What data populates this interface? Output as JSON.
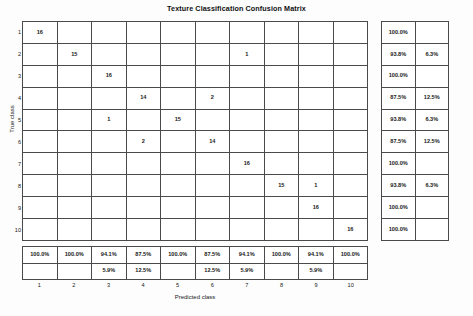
{
  "figure": {
    "title": "Texture Classification Confusion Matrix",
    "xlabel": "Predicted class",
    "ylabel": "True class"
  },
  "axis": {
    "xticks": [
      "1",
      "2",
      "3",
      "4",
      "5",
      "6",
      "7",
      "8",
      "9",
      "10"
    ],
    "yticks": [
      "1",
      "2",
      "3",
      "4",
      "5",
      "6",
      "7",
      "8",
      "9",
      "10"
    ]
  },
  "chart_data": {
    "type": "heatmap",
    "title": "Texture Classification Confusion Matrix",
    "xlabel": "Predicted class",
    "ylabel": "True class",
    "categories": [
      "1",
      "2",
      "3",
      "4",
      "5",
      "6",
      "7",
      "8",
      "9",
      "10"
    ],
    "grid": true,
    "legend": "none",
    "matrix": [
      [
        "16",
        "",
        "",
        "",
        "",
        "",
        "",
        "",
        "",
        ""
      ],
      [
        "",
        "15",
        "",
        "",
        "",
        "",
        "1",
        "",
        "",
        ""
      ],
      [
        "",
        "",
        "16",
        "",
        "",
        "",
        "",
        "",
        "",
        ""
      ],
      [
        "",
        "",
        "",
        "14",
        "",
        "2",
        "",
        "",
        "",
        ""
      ],
      [
        "",
        "",
        "1",
        "",
        "15",
        "",
        "",
        "",
        "",
        ""
      ],
      [
        "",
        "",
        "",
        "2",
        "",
        "14",
        "",
        "",
        "",
        ""
      ],
      [
        "",
        "",
        "",
        "",
        "",
        "",
        "16",
        "",
        "",
        ""
      ],
      [
        "",
        "",
        "",
        "",
        "",
        "",
        "",
        "15",
        "1",
        ""
      ],
      [
        "",
        "",
        "",
        "",
        "",
        "",
        "",
        "",
        "16",
        ""
      ],
      [
        "",
        "",
        "",
        "",
        "",
        "",
        "",
        "",
        "",
        "16"
      ]
    ],
    "cell_kind": [
      [
        "diag",
        "blank",
        "blank",
        "blank",
        "blank",
        "blank",
        "blank",
        "blank",
        "blank",
        "blank"
      ],
      [
        "blank",
        "diag",
        "blank",
        "blank",
        "blank",
        "blank",
        "err",
        "blank",
        "blank",
        "blank"
      ],
      [
        "blank",
        "blank",
        "diag",
        "blank",
        "blank",
        "blank",
        "blank",
        "blank",
        "blank",
        "blank"
      ],
      [
        "blank",
        "blank",
        "blank",
        "diag",
        "blank",
        "err",
        "blank",
        "blank",
        "blank",
        "blank"
      ],
      [
        "blank",
        "blank",
        "err",
        "blank",
        "diag",
        "blank",
        "blank",
        "blank",
        "blank",
        "blank"
      ],
      [
        "blank",
        "blank",
        "blank",
        "err",
        "blank",
        "diag",
        "blank",
        "blank",
        "blank",
        "blank"
      ],
      [
        "blank",
        "blank",
        "blank",
        "blank",
        "blank",
        "blank",
        "diag",
        "blank",
        "blank",
        "blank"
      ],
      [
        "blank",
        "blank",
        "blank",
        "blank",
        "blank",
        "blank",
        "blank",
        "diag",
        "err",
        "blank"
      ],
      [
        "blank",
        "blank",
        "blank",
        "blank",
        "blank",
        "blank",
        "blank",
        "blank",
        "diag",
        "blank"
      ],
      [
        "blank",
        "blank",
        "blank",
        "blank",
        "blank",
        "blank",
        "blank",
        "blank",
        "blank",
        "diag"
      ]
    ],
    "row_summary": {
      "correct_pct": [
        "100.0%",
        "93.8%",
        "100.0%",
        "87.5%",
        "93.8%",
        "87.5%",
        "100.0%",
        "93.8%",
        "100.0%",
        "100.0%"
      ],
      "error_pct": [
        "",
        "6.3%",
        "",
        "12.5%",
        "6.3%",
        "12.5%",
        "",
        "6.3%",
        "",
        ""
      ]
    },
    "col_summary": {
      "correct_pct": [
        "100.0%",
        "100.0%",
        "94.1%",
        "87.5%",
        "100.0%",
        "87.5%",
        "94.1%",
        "100.0%",
        "94.1%",
        "100.0%"
      ],
      "error_pct": [
        "",
        "",
        "5.9%",
        "12.5%",
        "",
        "12.5%",
        "5.9%",
        "",
        "5.9%",
        ""
      ]
    }
  },
  "colors": {
    "diagonal": "#4d4d4d",
    "error": "#d9d9d9",
    "blank": "#ffffff",
    "grid_line": "#4a4a4a",
    "background": "#fdfdfd"
  }
}
